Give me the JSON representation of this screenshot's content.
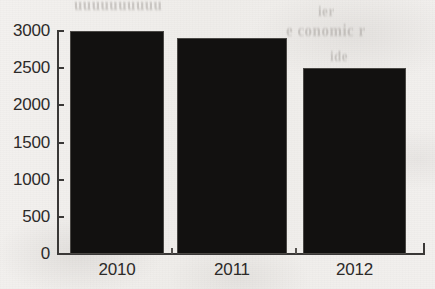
{
  "chart_data": {
    "type": "bar",
    "title": "",
    "subtitle": "",
    "xlabel": "",
    "ylabel": "",
    "categories": [
      "2010",
      "2011",
      "2012"
    ],
    "values": [
      3000,
      2900,
      2500
    ],
    "series": [
      {
        "name": "",
        "values": [
          3000,
          2900,
          2500
        ]
      }
    ],
    "ylim": [
      0,
      3000
    ],
    "y_ticks": [
      0,
      500,
      1000,
      1500,
      2000,
      2500,
      3000
    ],
    "y_tick_labels": [
      "0",
      "500",
      "1000",
      "1500",
      "2000",
      "2500",
      "3000"
    ],
    "x_tick_labels": [
      "2010",
      "2011",
      "2012"
    ],
    "grid": false,
    "legend": "none",
    "bar_color": "#121110",
    "axis_color": "#3a3837",
    "text_color": "#2c2a29",
    "background_color": "#f1efed"
  },
  "figure": {
    "ghost_bleed_text": {
      "top": "uuuuuuuuuu",
      "right_line_1": "ier",
      "right_line_2": "e conomic r",
      "right_line_3": "ide"
    }
  }
}
